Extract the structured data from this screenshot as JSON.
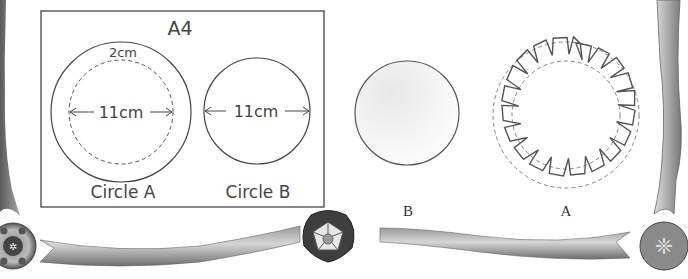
{
  "diagram": {
    "sheet": {
      "label": "A4",
      "circle_a": {
        "outer_border_label": "2cm",
        "inner_diameter_label": "11cm",
        "caption": "Circle A"
      },
      "circle_b": {
        "diameter_label": "11cm",
        "caption": "Circle B"
      }
    },
    "cut_circle_b": {
      "caption": "B"
    },
    "notched_circle_a": {
      "caption": "A",
      "notch_count": 16
    }
  },
  "colors": {
    "line": "#555555",
    "ribbon_dark": "#6a6a6a",
    "ribbon_light": "#c8c8c8"
  }
}
